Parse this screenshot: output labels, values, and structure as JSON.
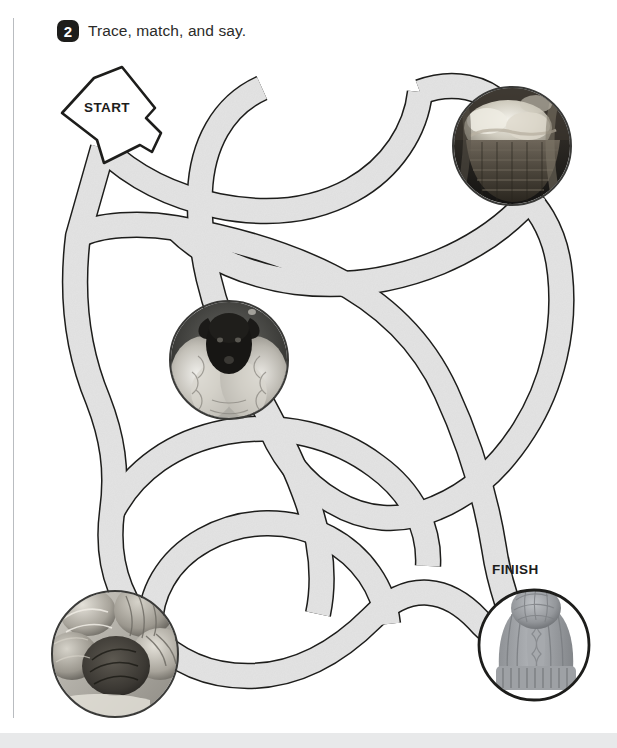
{
  "page": {
    "width": 617,
    "height": 748,
    "background_color": "#ffffff",
    "footer_band_color": "#e8e9ea",
    "margin_rule_color": "#b9bcc0"
  },
  "header": {
    "exercise_number": "2",
    "instruction": "Trace, match, and say.",
    "badge_color": "#1d1d1b",
    "text_color": "#2b2b29"
  },
  "maze": {
    "path_fill_color": "#e2e2e2",
    "path_stroke_color": "#1d1d1b",
    "path_width": 24,
    "start_label": "START",
    "finish_label": "FINISH"
  },
  "stations": [
    {
      "name": "wool-basket",
      "caption": "basket of raw wool fleece",
      "style": "plain",
      "cx": 512,
      "cy": 146,
      "r": 60
    },
    {
      "name": "sheep",
      "caption": "black-faced sheep",
      "style": "plain",
      "cx": 229,
      "cy": 360,
      "r": 60
    },
    {
      "name": "yarn-balls",
      "caption": "balls of yarn",
      "style": "plain",
      "cx": 115,
      "cy": 654,
      "r": 64
    },
    {
      "name": "bobble-hat",
      "caption": "grey knitted bobble hat",
      "style": "framed",
      "cx": 534,
      "cy": 645,
      "r": 57
    }
  ]
}
